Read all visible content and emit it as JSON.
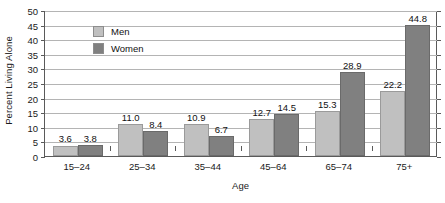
{
  "chart_data": {
    "type": "bar",
    "title": "",
    "xlabel": "Age",
    "ylabel": "Percent Living Alone",
    "categories": [
      "15–24",
      "25–34",
      "35–44",
      "45–64",
      "65–74",
      "75+"
    ],
    "series": [
      {
        "name": "Men",
        "color": "#c0c0c0",
        "values": [
          3.6,
          11.0,
          10.9,
          12.7,
          15.3,
          22.2
        ]
      },
      {
        "name": "Women",
        "color": "#808080",
        "values": [
          3.8,
          8.4,
          6.7,
          14.5,
          28.9,
          44.8
        ]
      }
    ],
    "value_labels": {
      "Men": [
        "3.6",
        "11.0",
        "10.9",
        "12.7",
        "15.3",
        "22.2"
      ],
      "Women": [
        "3.8",
        "8.4",
        "6.7",
        "14.5",
        "28.9",
        "44.8"
      ]
    },
    "ylim": [
      0,
      50
    ],
    "yticks": [
      0,
      5,
      10,
      15,
      20,
      25,
      30,
      35,
      40,
      45,
      50
    ],
    "ytick_labels": [
      "0",
      "5",
      "10",
      "15",
      "20",
      "25",
      "30",
      "35",
      "40",
      "45",
      "50"
    ],
    "grid": true,
    "legend_position": "top-left-inside",
    "legend_entries": [
      "Men",
      "Women"
    ]
  },
  "axes": {
    "y_title": "Percent Living Alone",
    "x_title": "Age"
  },
  "legend": {
    "men_label": "Men",
    "women_label": "Women"
  }
}
